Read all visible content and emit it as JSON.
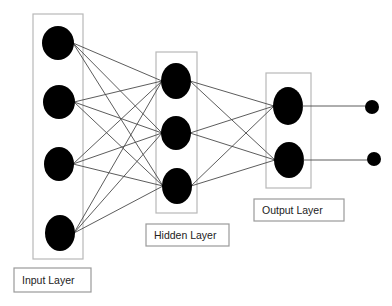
{
  "diagram": {
    "colors": {
      "node": "#000000",
      "edge": "#4a4a4a",
      "layer_box": "#b8b8b8",
      "label_box": "#9a9a9a",
      "text": "#222222"
    },
    "layers": [
      {
        "id": "input",
        "label": "Input Layer",
        "box": {
          "x": 33,
          "y": 14,
          "w": 50,
          "h": 245
        },
        "label_box": {
          "x": 14,
          "y": 268,
          "w": 77,
          "h": 24
        },
        "nodes": [
          {
            "cx": 58,
            "cy": 43,
            "rx": 16,
            "ry": 17
          },
          {
            "cx": 59,
            "cy": 102,
            "rx": 16,
            "ry": 17
          },
          {
            "cx": 59,
            "cy": 164,
            "rx": 15,
            "ry": 17
          },
          {
            "cx": 60,
            "cy": 233,
            "rx": 15,
            "ry": 18
          }
        ]
      },
      {
        "id": "hidden",
        "label": "Hidden Layer",
        "box": {
          "x": 156,
          "y": 52,
          "w": 41,
          "h": 161
        },
        "label_box": {
          "x": 146,
          "y": 224,
          "w": 83,
          "h": 22
        },
        "nodes": [
          {
            "cx": 176,
            "cy": 81,
            "rx": 15,
            "ry": 18
          },
          {
            "cx": 176,
            "cy": 133,
            "rx": 15,
            "ry": 17
          },
          {
            "cx": 177,
            "cy": 186,
            "rx": 15,
            "ry": 18
          }
        ]
      },
      {
        "id": "output",
        "label": "Output Layer",
        "box": {
          "x": 266,
          "y": 73,
          "w": 45,
          "h": 115
        },
        "label_box": {
          "x": 254,
          "y": 199,
          "w": 90,
          "h": 22
        },
        "nodes": [
          {
            "cx": 288,
            "cy": 106,
            "rx": 15,
            "ry": 19
          },
          {
            "cx": 289,
            "cy": 160,
            "rx": 15,
            "ry": 18
          }
        ]
      }
    ],
    "outputs": [
      {
        "cx": 372,
        "cy": 107,
        "r": 7
      },
      {
        "cx": 374,
        "cy": 159,
        "r": 7
      }
    ],
    "labels": {
      "input": "Input Layer",
      "hidden": "Hidden Layer",
      "output": "Output Layer"
    }
  }
}
